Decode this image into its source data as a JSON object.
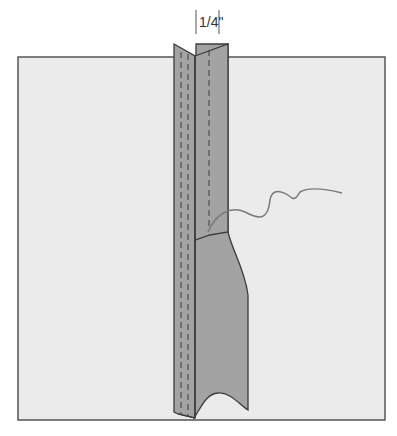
{
  "diagram": {
    "measurement_label": "1/4\"",
    "colors": {
      "background": "#ffffff",
      "fabric": "#ebebeb",
      "fabric_border": "#555555",
      "seam_allowance": "#a3a3a3",
      "seam_line": "#3c3c3c",
      "stitch_line": "#3c3c3c",
      "thread": "#7a7a7a"
    }
  }
}
